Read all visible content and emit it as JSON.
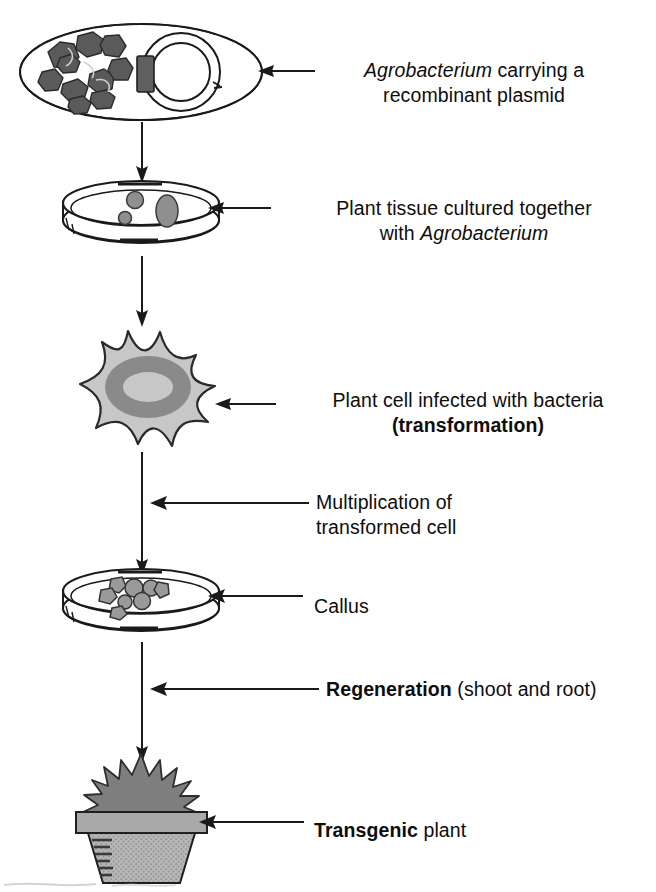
{
  "figure": {
    "background_color": "#ffffff",
    "ink_color": "#111111"
  },
  "palette": {
    "chromosome_gray": "#5a5a5a",
    "insert_gray": "#5f5f5f",
    "tissue_gray": "#8f8f8f",
    "cell_body_gray": "#c7c7c7",
    "nucleus_ring_gray": "#8a8a8a",
    "callus_cell_gray": "#9a9a9a",
    "foliage_gray": "#7e7e7e",
    "pot_rim_gray": "#a9a9a9",
    "pot_body_gray": "#b3b3b3",
    "outline": "#1a1a1a"
  },
  "steps": [
    {
      "id": "agrobacterium",
      "icon": "bacterium-with-plasmid-icon",
      "label_lines": [
        [
          {
            "text": "Agrobacterium",
            "style": "italic"
          },
          {
            "text": " carrying a",
            "style": "normal"
          }
        ],
        [
          {
            "text": "recombinant plasmid",
            "style": "normal"
          }
        ]
      ],
      "label_align": "center"
    },
    {
      "id": "coculture",
      "icon": "petri-dish-tissue-icon",
      "label_lines": [
        [
          {
            "text": "Plant tissue cultured together",
            "style": "normal"
          }
        ],
        [
          {
            "text": "with ",
            "style": "normal"
          },
          {
            "text": "Agrobacterium",
            "style": "italic"
          }
        ]
      ],
      "label_align": "center"
    },
    {
      "id": "infected-cell",
      "icon": "plant-cell-icon",
      "label_lines": [
        [
          {
            "text": "Plant cell infected with bacteria",
            "style": "normal"
          }
        ],
        [
          {
            "text": "(transformation)",
            "style": "bold"
          }
        ]
      ],
      "label_align": "center"
    },
    {
      "id": "multiplication",
      "icon": "none",
      "label_lines": [
        [
          {
            "text": "Multiplication of",
            "style": "normal"
          }
        ],
        [
          {
            "text": "transformed cell",
            "style": "normal"
          }
        ]
      ],
      "label_align": "left"
    },
    {
      "id": "callus",
      "icon": "petri-dish-callus-icon",
      "label_lines": [
        [
          {
            "text": "Callus",
            "style": "normal"
          }
        ]
      ],
      "label_align": "left"
    },
    {
      "id": "regeneration",
      "icon": "none",
      "label_lines": [
        [
          {
            "text": "Regeneration",
            "style": "bold"
          },
          {
            "text": " (shoot and root)",
            "style": "normal"
          }
        ]
      ],
      "label_align": "left"
    },
    {
      "id": "transgenic-plant",
      "icon": "potted-plant-icon",
      "label_lines": [
        [
          {
            "text": "Transgenic",
            "style": "bold"
          },
          {
            "text": " plant",
            "style": "normal"
          }
        ]
      ],
      "label_align": "left"
    }
  ]
}
